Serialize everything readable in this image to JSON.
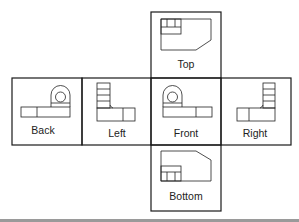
{
  "diagram": {
    "title": "",
    "views": {
      "top": {
        "label": "Top"
      },
      "back": {
        "label": "Back"
      },
      "left": {
        "label": "Left"
      },
      "front": {
        "label": "Front"
      },
      "right": {
        "label": "Right"
      },
      "bottom": {
        "label": "Bottom"
      }
    },
    "colors": {
      "line": "#1a1a1a",
      "background": "#ffffff",
      "footer_rule": "#9a9a9a"
    }
  }
}
